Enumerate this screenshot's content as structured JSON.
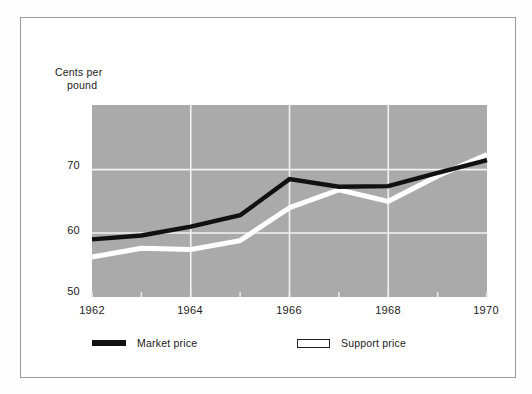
{
  "figure": {
    "background_color": "#ffffff",
    "frame_color": "#9a9a9a",
    "plot_background_color": "#aaaaaa",
    "gridline_color": "#f2f2f2"
  },
  "axis": {
    "y_title_line1": "Cents per",
    "y_title_line2": "pound",
    "y_ticks": [
      "70",
      "60",
      "50"
    ],
    "x_ticks": [
      "1962",
      "1964",
      "1966",
      "1968",
      "1970"
    ]
  },
  "legend": {
    "items": [
      {
        "label": "Market price",
        "swatch": "thick-black-line",
        "color": "#111111"
      },
      {
        "label": "Support price",
        "swatch": "white-outlined-bar",
        "color": "#ffffff"
      }
    ]
  },
  "chart_data": {
    "type": "line",
    "title": "",
    "subtitle": "",
    "xlabel": "",
    "ylabel": "Cents per pound",
    "xlim": [
      1962,
      1970
    ],
    "ylim": [
      50,
      75
    ],
    "xticks": [
      1962,
      1964,
      1966,
      1968,
      1970
    ],
    "yticks": [
      50,
      60,
      70
    ],
    "grid": true,
    "grid_axis": "both",
    "legend_position": "below-axes",
    "x": [
      1962,
      1963,
      1964,
      1965,
      1966,
      1967,
      1968,
      1969,
      1970
    ],
    "series": [
      {
        "name": "Market price",
        "color": "#111111",
        "values": [
          59.0,
          59.6,
          61.0,
          62.8,
          68.5,
          67.3,
          67.4,
          69.5,
          71.5
        ]
      },
      {
        "name": "Support price",
        "color": "#ffffff",
        "values": [
          56.2,
          57.6,
          57.4,
          58.8,
          64.0,
          66.8,
          65.0,
          69.0,
          72.4
        ]
      }
    ]
  },
  "geometry": {
    "plot_left": 92,
    "plot_right": 487,
    "plot_top": 105,
    "plot_bottom": 297,
    "y_value_at_top": 80.2,
    "y_value_at_bottom": 49.9
  }
}
